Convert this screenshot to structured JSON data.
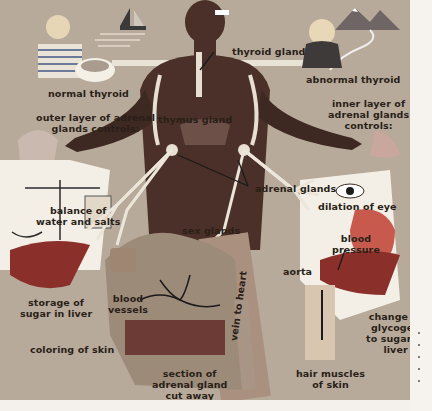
{
  "diagram": {
    "labels": {
      "normal_thyroid": "normal thyroid",
      "thyroid_gland": "thyroid gland",
      "abnormal_thyroid": "abnormal thyroid",
      "outer_layer_1": "outer layer of adrenal",
      "outer_layer_2": "glands controls:",
      "thymus_gland": "thymus gland",
      "inner_layer_1": "inner layer of",
      "inner_layer_2": "adrenal glands",
      "inner_layer_3": "controls:",
      "adrenal_glands": "adrenal glands",
      "balance_1": "balance of",
      "balance_2": "water and salts",
      "dilation_of_eye": "dilation of eye",
      "sex_glands": "sex glands",
      "blood_pressure_1": "blood",
      "blood_pressure_2": "pressure",
      "aorta": "aorta",
      "storage_1": "storage of",
      "storage_2": "sugar in liver",
      "blood_vessels_1": "blood",
      "blood_vessels_2": "vessels",
      "vein_to_heart": "vein to heart",
      "coloring_of_skin": "coloring of skin",
      "section_1": "section of",
      "section_2": "adrenal gland",
      "section_3": "cut away",
      "hair_muscles_1": "hair muscles",
      "hair_muscles_2": "of skin",
      "glycogen_1": "change of",
      "glycogen_2": "glycogen",
      "glycogen_3": "to sugar in",
      "glycogen_4": "liver"
    },
    "colors": {
      "background": "#b7aa9a",
      "body": "#4a3028",
      "label_text": "#2a1f18",
      "highlight_white": "#f3efe6",
      "organ_red": "#b8453a",
      "page_margin": "#f6f3ee"
    }
  }
}
